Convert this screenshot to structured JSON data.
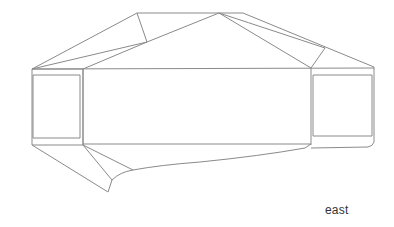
{
  "drawing": {
    "type": "building-elevation-line-drawing",
    "view_label": "east",
    "stroke_color": "#8a8a8a",
    "background": "#ffffff",
    "components": [
      "left-roof-facet",
      "central-roof-peak",
      "right-roof-facet",
      "main-facade-band",
      "left-end-panel",
      "right-end-panel",
      "lower-left-wing",
      "base-curve"
    ]
  }
}
